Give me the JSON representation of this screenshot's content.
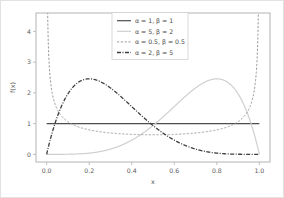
{
  "chart_data": {
    "type": "line",
    "title": "",
    "xlabel": "x",
    "ylabel": "f(x)",
    "xlim": [
      -0.05,
      1.05
    ],
    "ylim": [
      -0.25,
      4.6
    ],
    "grid": false,
    "legend_position": "upper center",
    "xticks": [
      "0.0",
      "0.2",
      "0.4",
      "0.6",
      "0.8",
      "1.0"
    ],
    "xtick_values": [
      0.0,
      0.2,
      0.4,
      0.6,
      0.8,
      1.0
    ],
    "yticks": [
      "0",
      "1",
      "2",
      "3",
      "4"
    ],
    "ytick_values": [
      0,
      1,
      2,
      3,
      4
    ],
    "series": [
      {
        "name": "α = 1, β = 1",
        "alpha": 1,
        "beta": 1,
        "color": "#4d4d4d",
        "linestyle": "solid",
        "dasharray": "",
        "width": 1.2,
        "peak_x": null,
        "peak_y": 1.0
      },
      {
        "name": "α = 5, β = 2",
        "alpha": 5,
        "beta": 2,
        "color": "#cfcfcf",
        "linestyle": "solid",
        "dasharray": "",
        "width": 1.2,
        "peak_x": 0.8,
        "peak_y": 2.458
      },
      {
        "name": "α = 0.5, β = 0.5",
        "alpha": 0.5,
        "beta": 0.5,
        "color": "#9a9a9a",
        "linestyle": "dashed",
        "dasharray": "2.2,1.6",
        "width": 1.0,
        "peak_x": 0.5,
        "peak_y": 0.637
      },
      {
        "name": "α = 2, β = 5",
        "alpha": 2,
        "beta": 5,
        "color": "#3d3d3d",
        "linestyle": "dashdot",
        "dasharray": "4,1.5,1,1.5",
        "width": 1.3,
        "peak_x": 0.2,
        "peak_y": 2.458
      }
    ]
  },
  "legend": {
    "entries": [
      "α = 1, β = 1",
      "α = 5, β = 2",
      "α = 0.5, β = 0.5",
      "α = 2, β = 5"
    ]
  }
}
